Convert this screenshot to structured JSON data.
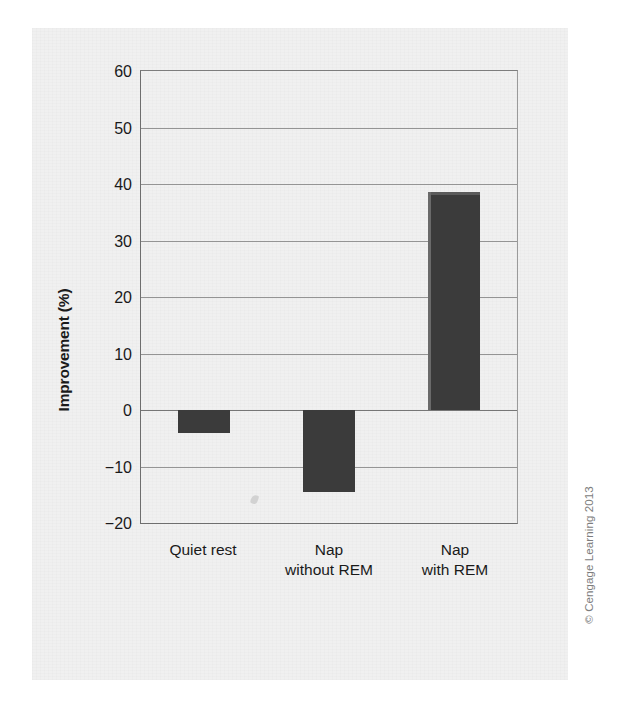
{
  "figure": {
    "credit": "© Cengage Learning 2013"
  },
  "chart_data": {
    "type": "bar",
    "title": "",
    "subtitle": "",
    "xlabel": "",
    "ylabel": "Improvement (%)",
    "ylim": [
      -20,
      60
    ],
    "yticks": [
      60,
      50,
      40,
      30,
      20,
      10,
      0,
      -10,
      -20
    ],
    "ytick_labels": [
      "60",
      "50",
      "40",
      "30",
      "20",
      "10",
      "0",
      "-10",
      "-20"
    ],
    "grid": true,
    "grid_axis": "y",
    "legend": false,
    "legend_position": "none",
    "bar_color": "#3b3b3b",
    "categories": [
      "Quiet rest",
      "Nap without REM",
      "Nap with REM"
    ],
    "category_lines": [
      [
        "Quiet rest",
        ""
      ],
      [
        "Nap",
        "without REM"
      ],
      [
        "Nap",
        "with REM"
      ]
    ],
    "values": [
      -4,
      -14.5,
      38.5
    ]
  }
}
